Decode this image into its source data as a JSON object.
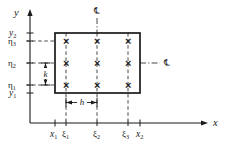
{
  "figure": {
    "kind": "mesh-grid-diagram",
    "background_color": "#ffffff",
    "line_color": "#1a1a1a",
    "axes": {
      "x_axis_label": "x",
      "y_axis_label": "y"
    },
    "y_tick_labels": [
      {
        "id": "y2",
        "base": "y",
        "sub": "2",
        "style": "italic"
      },
      {
        "id": "eta3",
        "base": "η",
        "sub": "3",
        "style": "greek"
      },
      {
        "id": "eta2",
        "base": "η",
        "sub": "2",
        "style": "greek"
      },
      {
        "id": "eta1",
        "base": "η",
        "sub": "1",
        "style": "greek"
      },
      {
        "id": "y1",
        "base": "y",
        "sub": "1",
        "style": "italic"
      }
    ],
    "x_tick_labels": [
      {
        "id": "x1",
        "base": "x",
        "sub": "1",
        "style": "italic"
      },
      {
        "id": "xi1",
        "base": "ξ",
        "sub": "1",
        "style": "greek"
      },
      {
        "id": "xi2",
        "base": "ξ",
        "sub": "2",
        "style": "greek"
      },
      {
        "id": "xi3",
        "base": "ξ",
        "sub": "3",
        "style": "greek"
      },
      {
        "id": "x2",
        "base": "x",
        "sub": "2",
        "style": "italic"
      }
    ],
    "dimensions": [
      {
        "id": "h-dimension",
        "label": "h",
        "orientation": "horizontal",
        "spans": "xi1-to-xi2"
      },
      {
        "id": "k-dimension",
        "label": "k",
        "orientation": "vertical",
        "spans": "eta1-to-eta2"
      }
    ],
    "centerlines": [
      {
        "id": "vertical-centerline",
        "symbol": "℄",
        "orientation": "vertical"
      },
      {
        "id": "horizontal-centerline",
        "symbol": "℄",
        "orientation": "horizontal"
      }
    ],
    "grid_nodes": {
      "marker": "×",
      "rows": 3,
      "columns": 3,
      "count": 9
    }
  }
}
